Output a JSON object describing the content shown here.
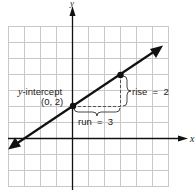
{
  "diagram": {
    "title": "",
    "axes": {
      "x_label": "x",
      "y_label": "y"
    },
    "grid": {
      "x_min": -4,
      "x_max": 6,
      "y_min": -3,
      "y_max": 7,
      "unit_px": 16,
      "origin_px": [
        72,
        138
      ],
      "color": "#c8c8c8"
    },
    "line": {
      "slope": 0.6667,
      "y_intercept": 2,
      "color": "#111111"
    },
    "points": [
      {
        "name": "y-intercept",
        "x": 0,
        "y": 2
      },
      {
        "name": "second-point",
        "x": 3,
        "y": 4
      }
    ],
    "labels": {
      "y_intercept_title": "y-intercept",
      "y_intercept_coords": "(0, 2)",
      "rise": "rise  =  2",
      "run": "run  =  3"
    }
  }
}
